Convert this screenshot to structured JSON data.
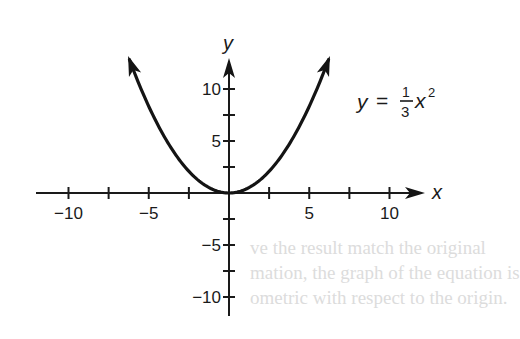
{
  "chart_data": {
    "type": "line",
    "title": "",
    "equation": "y = (1/3)x^2",
    "equation_label": {
      "lhs": "y",
      "equals": "=",
      "numerator": "1",
      "denominator": "3",
      "variable": "x",
      "exponent": "2"
    },
    "xlabel": "x",
    "ylabel": "y",
    "xlim": [
      -12,
      12.2
    ],
    "ylim": [
      -11.9,
      13.2
    ],
    "x_ticks": [
      -10,
      -7.5,
      -5,
      -2.5,
      0,
      2.5,
      5,
      7.5,
      10
    ],
    "y_ticks": [
      -10,
      -7.5,
      -5,
      -2.5,
      0,
      2.5,
      5,
      7.5,
      10
    ],
    "x_tick_labels": [
      {
        "value": -10,
        "label": "−10"
      },
      {
        "value": -5,
        "label": "−5"
      },
      {
        "value": 5,
        "label": "5"
      },
      {
        "value": 10,
        "label": "10"
      }
    ],
    "y_tick_labels": [
      {
        "value": 10,
        "label": "10"
      },
      {
        "value": 5,
        "label": "5"
      },
      {
        "value": -5,
        "label": "−5"
      },
      {
        "value": -10,
        "label": "−10"
      }
    ],
    "grid": false,
    "series": [
      {
        "name": "y = 1/3 x^2",
        "x": [
          -6.2,
          -6,
          -5,
          -4,
          -3,
          -2,
          -1,
          0,
          1,
          2,
          3,
          4,
          5,
          6,
          6.2
        ],
        "y": [
          12.81,
          12,
          8.33,
          5.33,
          3,
          1.33,
          0.33,
          0,
          0.33,
          1.33,
          3,
          5.33,
          8.33,
          12,
          12.81
        ],
        "arrows_at_ends": true
      }
    ],
    "curve_domain": [
      -6.2,
      6.2
    ]
  },
  "layout": {
    "origin_px": [
      229,
      193
    ],
    "x_px_per_unit": 16.05,
    "y_px_per_unit": 10.4,
    "x_axis_px": [
      36,
      425
    ],
    "y_axis_px": [
      58,
      316
    ],
    "colors": {
      "ink": "#1a1a1a",
      "bleed": "#dcdcdc",
      "background": "#ffffff"
    }
  },
  "bleed_through_text": [
    "ve the result match the original",
    "mation, the graph of the equation is",
    "ometric with respect to the origin."
  ]
}
